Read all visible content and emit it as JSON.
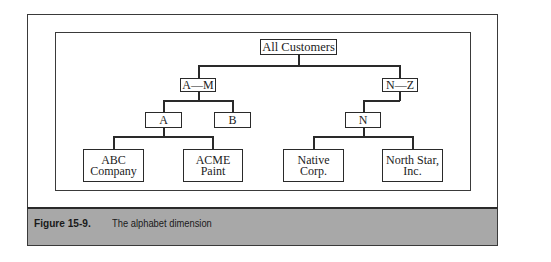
{
  "figure": {
    "label": "Figure 15-9.",
    "caption": "The alphabet dimension"
  },
  "tree": {
    "root": "All Customers",
    "level1": [
      "A—M",
      "N—Z"
    ],
    "level2": [
      "A",
      "B",
      "N"
    ],
    "leaves": [
      {
        "line1": "ABC",
        "line2": "Company"
      },
      {
        "line1": "ACME",
        "line2": "Paint"
      },
      {
        "line1": "Native",
        "line2": "Corp."
      },
      {
        "line1": "North Star,",
        "line2": "Inc."
      }
    ]
  },
  "colors": {
    "caption_band": "#a8a8a8",
    "border": "#2a2a2a"
  }
}
